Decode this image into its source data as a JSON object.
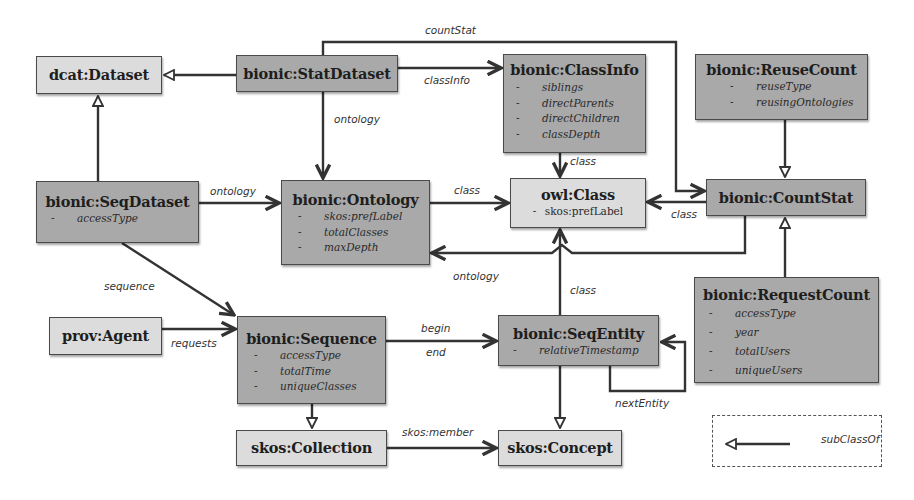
{
  "diagram": {
    "type": "ontology-class-diagram",
    "nodes": {
      "dcat_dataset": {
        "title": "dcat:Dataset",
        "attributes": []
      },
      "stat_dataset": {
        "title": "bionic:StatDataset",
        "attributes": []
      },
      "class_info": {
        "title": "bionic:ClassInfo",
        "attributes": [
          "siblings",
          "directParents",
          "directChildren",
          "classDepth"
        ]
      },
      "reuse_count": {
        "title": "bionic:ReuseCount",
        "attributes": [
          "reuseType",
          "reusingOntologies"
        ]
      },
      "seq_dataset": {
        "title": "bionic:SeqDataset",
        "attributes": [
          "accessType"
        ]
      },
      "ontology": {
        "title": "bionic:Ontology",
        "attributes": [
          "skos:prefLabel",
          "totalClasses",
          "maxDepth"
        ]
      },
      "owl_class": {
        "title": "owl:Class",
        "attributes": [
          "skos:prefLabel"
        ]
      },
      "count_stat": {
        "title": "bionic:CountStat",
        "attributes": []
      },
      "request_count": {
        "title": "bionic:RequestCount",
        "attributes": [
          "accessType",
          "year",
          "totalUsers",
          "uniqueUsers"
        ]
      },
      "prov_agent": {
        "title": "prov:Agent",
        "attributes": []
      },
      "sequence": {
        "title": "bionic:Sequence",
        "attributes": [
          "accessType",
          "totalTime",
          "uniqueClasses"
        ]
      },
      "seq_entity": {
        "title": "bionic:SeqEntity",
        "attributes": [
          "relativeTimestamp"
        ]
      },
      "skos_collection": {
        "title": "skos:Collection",
        "attributes": []
      },
      "skos_concept": {
        "title": "skos:Concept",
        "attributes": []
      }
    },
    "edges": {
      "count_stat": {
        "label": "countStat",
        "from": "bionic:StatDataset",
        "to": "bionic:CountStat"
      },
      "class_info": {
        "label": "classInfo",
        "from": "bionic:StatDataset",
        "to": "bionic:ClassInfo"
      },
      "stat_ontology": {
        "label": "ontology",
        "from": "bionic:StatDataset",
        "to": "bionic:Ontology"
      },
      "seq_ontology": {
        "label": "ontology",
        "from": "bionic:SeqDataset",
        "to": "bionic:Ontology"
      },
      "ontology_class": {
        "label": "class",
        "from": "bionic:Ontology",
        "to": "owl:Class"
      },
      "classinfo_class": {
        "label": "class",
        "from": "bionic:ClassInfo",
        "to": "owl:Class"
      },
      "countstat_class": {
        "label": "class",
        "from": "bionic:CountStat",
        "to": "owl:Class"
      },
      "countstat_ontology": {
        "label": "ontology",
        "from": "bionic:CountStat",
        "to": "bionic:Ontology"
      },
      "seqentity_class": {
        "label": "class",
        "from": "bionic:SeqEntity",
        "to": "owl:Class"
      },
      "sequence": {
        "label": "sequence",
        "from": "bionic:SeqDataset",
        "to": "bionic:Sequence"
      },
      "requests": {
        "label": "requests",
        "from": "prov:Agent",
        "to": "bionic:Sequence"
      },
      "begin": {
        "label": "begin",
        "from": "bionic:Sequence",
        "to": "bionic:SeqEntity"
      },
      "end": {
        "label": "end",
        "from": "bionic:Sequence",
        "to": "bionic:SeqEntity"
      },
      "next_entity": {
        "label": "nextEntity",
        "from": "bionic:SeqEntity",
        "to": "bionic:SeqEntity"
      },
      "skos_member": {
        "label": "skos:member",
        "from": "skos:Collection",
        "to": "skos:Concept"
      }
    },
    "subclass_relations": [
      {
        "sub": "bionic:StatDataset",
        "super": "dcat:Dataset"
      },
      {
        "sub": "bionic:SeqDataset",
        "super": "dcat:Dataset"
      },
      {
        "sub": "bionic:ReuseCount",
        "super": "bionic:CountStat"
      },
      {
        "sub": "bionic:RequestCount",
        "super": "bionic:CountStat"
      },
      {
        "sub": "bionic:Sequence",
        "super": "skos:Collection"
      },
      {
        "sub": "bionic:SeqEntity",
        "super": "skos:Concept"
      }
    ],
    "legend": {
      "label": "subClassOf"
    },
    "colors": {
      "light_box": "#dcdcdc",
      "dark_box": "#a9a9a9",
      "line": "#333333"
    }
  }
}
